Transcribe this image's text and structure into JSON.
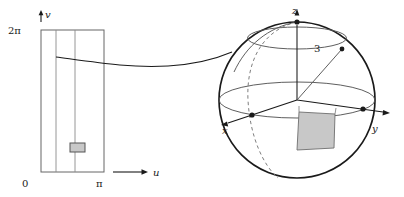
{
  "figure": {
    "background_color": "#ffffff",
    "stroke_color": "#1a1a1a",
    "thin_stroke_color": "#555555",
    "patch_fill_color": "#c8c8c8",
    "patch_stroke_color": "#666666"
  },
  "domain_panel": {
    "axis_u_label": "u",
    "axis_v_label": "v",
    "origin_label": "0",
    "u_max_label": "π",
    "v_max_label": "2π",
    "rect": {
      "x": 41,
      "y": 30,
      "width": 63,
      "height": 142
    },
    "grid_lines_u": [
      56,
      75
    ],
    "patch": {
      "x": 70,
      "y": 143,
      "width": 15,
      "height": 9
    }
  },
  "sphere_panel": {
    "axis_x_label": "x",
    "axis_y_label": "y",
    "axis_z_label": "z",
    "radius_label": "3",
    "center": {
      "x": 297,
      "y": 100
    },
    "radius_px": 78,
    "radius_line_end": {
      "x": 342,
      "y": 49
    },
    "patch_label": "spherical-patch"
  },
  "connector": {
    "label": "mapping-curve",
    "from": {
      "x": 56,
      "y": 57
    },
    "to": {
      "x": 232,
      "y": 52
    }
  }
}
